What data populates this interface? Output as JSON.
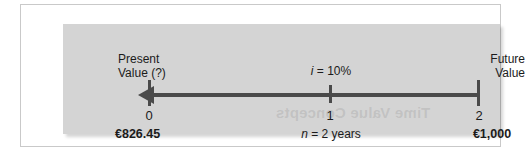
{
  "figure": {
    "type": "time-line-diagram",
    "panel_color": "#d4d4d4",
    "line_color": "#4a4a4a",
    "text_color": "#1b1b1b",
    "ghost_text": "Time Value Concepts"
  },
  "labels": {
    "present_value": "Present\nValue (?)",
    "present_value_line1": "Present",
    "present_value_line2": "Value (?)",
    "future_value_line1": "Future",
    "future_value_line2": "Value",
    "interest_rate": "i = 10%",
    "interest_rate_symbol": "i",
    "interest_rate_value": "= 10%",
    "periods_symbol": "n",
    "periods_value": "= 2 years"
  },
  "timeline": {
    "direction": "right-to-left",
    "periods": [
      {
        "index": "0",
        "amount": "€826.45"
      },
      {
        "index": "1",
        "amount": ""
      },
      {
        "index": "2",
        "amount": "€1,000"
      }
    ],
    "period_0": "0",
    "period_1": "1",
    "period_2": "2",
    "amount_present": "€826.45",
    "amount_future": "€1,000"
  }
}
